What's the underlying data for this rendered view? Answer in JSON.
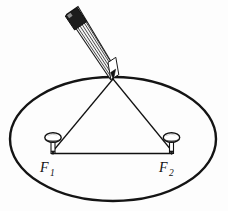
{
  "figure": {
    "background_color": "#fdfdfd",
    "ink_color": "#1a1a1a",
    "line_color": "#111111",
    "width": 228,
    "height": 211
  },
  "labels": {
    "focus_1": "F",
    "focus_1_sub": "1",
    "focus_2": "F",
    "focus_2_sub": "2"
  },
  "geometry": {
    "ellipse": {
      "center_x": 113,
      "center_y": 139,
      "radius_x": 103,
      "radius_y": 62,
      "stroke_width": 2.4
    },
    "apex": {
      "x": 113,
      "y": 78
    },
    "focus_1_point": {
      "x": 52,
      "y": 152
    },
    "focus_2_point": {
      "x": 172,
      "y": 152
    },
    "string_stroke_width": 1.2,
    "baseline_stroke_width": 1.3
  },
  "pins": {
    "head_radius_x": 8,
    "head_radius_y": 5,
    "stem_height": 12,
    "head_fill": "#ffffff",
    "head_stroke": "#111111"
  },
  "pencil": {
    "tip_x": 113,
    "tip_y": 78,
    "eraser_x": 72,
    "eraser_y": 12,
    "barrel_width": 11,
    "ferrule_color": "#1c1c1c",
    "barrel_stripe_color": "#2a2a2a",
    "barrel_fill": "#f2f2f2",
    "stripe_count": 5
  },
  "icons": {
    "pencil": "pencil-icon",
    "pin_left": "pushpin-icon",
    "pin_right": "pushpin-icon",
    "ellipse": "ellipse-curve-icon"
  }
}
